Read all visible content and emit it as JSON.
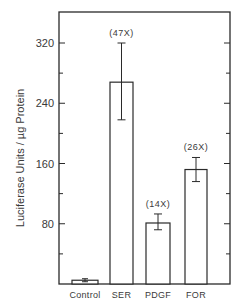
{
  "chart_data": {
    "type": "bar",
    "title": "",
    "xlabel": "",
    "ylabel": "Luciferase Units / µg Protein",
    "ylim": [
      0,
      360
    ],
    "yticks": [
      80,
      160,
      240,
      320
    ],
    "minor_ticks": [
      40,
      120,
      200,
      280
    ],
    "grid": false,
    "categories": [
      "Control",
      "SER",
      "PDGF",
      "FOR"
    ],
    "values": [
      5,
      268,
      81,
      152
    ],
    "error_low": [
      3,
      218,
      72,
      136
    ],
    "error_high": [
      7,
      320,
      93,
      168
    ],
    "annotations": [
      "",
      "(47X)",
      "(14X)",
      "(26X)"
    ]
  },
  "colors": {
    "bar_fill": "#ffffff",
    "stroke": "#2a2a2a"
  }
}
